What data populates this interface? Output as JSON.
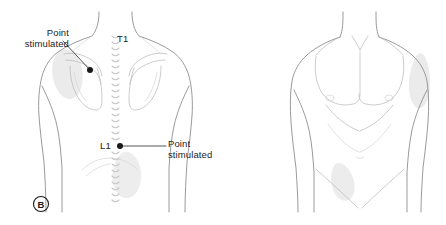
{
  "figure": {
    "panel_label": "B",
    "background_color": "#ffffff",
    "outline_color": "#8d8f91",
    "shade_color": "#e8e8e8",
    "marker_color": "#17191b",
    "width": 446,
    "height": 225
  },
  "annotations": {
    "upper_callout": {
      "line1": "Point",
      "line2": "stimulated"
    },
    "lower_callout": {
      "line1": "Point",
      "line2": "stimulated"
    }
  },
  "spinal_levels": {
    "thoracic": "T1",
    "lumbar": "L1"
  },
  "views": {
    "posterior": {
      "name": "posterior-torso",
      "stimulation_points": [
        {
          "id": "scapular-point",
          "x": 90,
          "y": 70
        },
        {
          "id": "lumbar-point",
          "x": 120,
          "y": 146
        }
      ],
      "shaded_regions": [
        {
          "id": "left-scapular-shading"
        },
        {
          "id": "left-lumbar-shading"
        }
      ],
      "vertebra_count": 26
    },
    "anterior": {
      "name": "anterior-torso",
      "shaded_regions": [
        {
          "id": "left-upper-arm-shading"
        },
        {
          "id": "left-iliac-shading"
        }
      ]
    }
  }
}
